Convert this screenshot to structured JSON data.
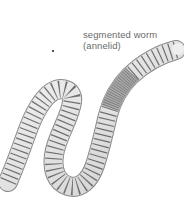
{
  "figure": {
    "label_line1": "segmented worm",
    "label_line2": "(annelid)",
    "colors": {
      "body": "#e4e4e4",
      "segment_lines": "#6e6e6e",
      "clitellum": "#b8b8b8",
      "label_text": "#6a6a6a"
    }
  }
}
